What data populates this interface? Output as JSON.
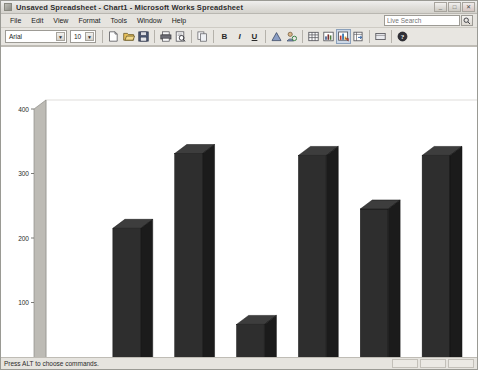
{
  "window": {
    "title": "Unsaved Spreadsheet - Chart1 - Microsoft Works Spreadsheet",
    "title_icon": "spreadsheet-icon",
    "buttons": {
      "minimize": "_",
      "maximize": "□",
      "close": "✕"
    }
  },
  "menu": {
    "items": [
      {
        "label": "File"
      },
      {
        "label": "Edit"
      },
      {
        "label": "View"
      },
      {
        "label": "Format"
      },
      {
        "label": "Tools"
      },
      {
        "label": "Window"
      },
      {
        "label": "Help"
      }
    ]
  },
  "search": {
    "placeholder": "Live Search",
    "button_icon": "search-icon"
  },
  "toolbar": {
    "font_name": "Arial",
    "font_size": "10",
    "arrow": "▼",
    "bold_label": "B",
    "italic_label": "I",
    "underline_label": "U",
    "buttons": [
      {
        "name": "new-icon"
      },
      {
        "name": "open-icon"
      },
      {
        "name": "save-icon"
      },
      {
        "name": "print-icon"
      },
      {
        "name": "print-preview-icon"
      },
      {
        "name": "copy-icon"
      },
      {
        "name": "easy-calc-icon"
      },
      {
        "name": "address-book-icon"
      },
      {
        "name": "insert-table-icon"
      },
      {
        "name": "insert-chart-icon"
      },
      {
        "name": "chart-type-icon"
      },
      {
        "name": "spreadsheet-view-icon"
      },
      {
        "name": "toolbar-display-icon"
      },
      {
        "name": "help-icon"
      }
    ]
  },
  "status": {
    "text": "Press ALT to choose commands.",
    "panels": 3
  },
  "chart_data": {
    "type": "bar",
    "title": "",
    "subtitle": "",
    "xlabel": "",
    "ylabel": "",
    "categories": [
      "Stamp Collection",
      "January",
      "February",
      "March",
      "April",
      "May",
      "June"
    ],
    "values": [
      0,
      215,
      331,
      66,
      328,
      245,
      328
    ],
    "series": [
      {
        "name": "Series 1",
        "values": [
          0,
          215,
          331,
          66,
          328,
          245,
          328
        ]
      }
    ],
    "ylim": [
      0,
      400
    ],
    "yticks": [
      0,
      100,
      200,
      300,
      400
    ],
    "ytick_labels": [
      "0",
      "100",
      "200",
      "300",
      "400"
    ],
    "grid": false,
    "legend": {
      "position": "bottom",
      "entries": [
        "Series 1"
      ]
    },
    "bar_color": "#2e2e2e",
    "bar_side_color": "#1b1b1b",
    "bar_top_color": "#3d3d3d",
    "axis_color": "#b0aea8",
    "wall_color": "#ffffff",
    "plot_bg": "#ffffff"
  }
}
